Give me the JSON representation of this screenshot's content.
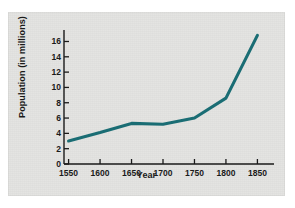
{
  "figure": {
    "background_color": "#e4e4e2",
    "line_color": "#1a6d74",
    "axis_color": "#1a1a1a"
  },
  "chart_data": {
    "type": "line",
    "title": "",
    "xlabel": "Year",
    "ylabel": "Population (in millions)",
    "x": [
      1550,
      1600,
      1650,
      1700,
      1750,
      1800,
      1850
    ],
    "values": [
      3.0,
      4.1,
      5.3,
      5.2,
      6.0,
      8.6,
      16.8
    ],
    "series": [
      {
        "name": "Population",
        "values": [
          3.0,
          4.1,
          5.3,
          5.2,
          6.0,
          8.6,
          16.8
        ]
      }
    ],
    "xticks": [
      1550,
      1600,
      1650,
      1700,
      1750,
      1800,
      1850
    ],
    "xtick_labels": [
      "1550",
      "1600",
      "1650",
      "1700",
      "1750",
      "1800",
      "1850"
    ],
    "yticks": [
      0,
      2,
      4,
      6,
      8,
      10,
      12,
      14,
      16
    ],
    "ytick_labels": [
      "0",
      "2",
      "4",
      "6",
      "8",
      "10",
      "12",
      "14",
      "16"
    ],
    "xlim": [
      1530,
      1870
    ],
    "ylim": [
      0,
      17.5
    ],
    "grid": false,
    "legend": null,
    "legend_position": "none",
    "annotations": []
  }
}
